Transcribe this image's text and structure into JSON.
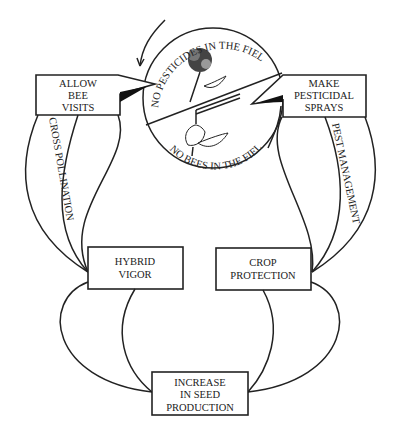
{
  "diagram": {
    "circle": {
      "top_arc_label": "NO PESTICIDES IN THE FIELD",
      "bottom_arc_label": "NO BEES IN THE FIELD"
    },
    "boxes": {
      "allow_bee_visits": [
        "ALLOW",
        "BEE",
        "VISITS"
      ],
      "make_pesticidal_sprays": [
        "MAKE",
        "PESTICIDAL",
        "SPRAYS"
      ],
      "hybrid_vigor": [
        "HYBRID",
        "VIGOR"
      ],
      "crop_protection": [
        "CROP",
        "PROTECTION"
      ],
      "increase_seed_production": [
        "INCREASE",
        "IN SEED",
        "PRODUCTION"
      ]
    },
    "connectors": {
      "left_label": "CROSS POLLINATION",
      "right_label": "PEST MANAGEMENT"
    }
  }
}
